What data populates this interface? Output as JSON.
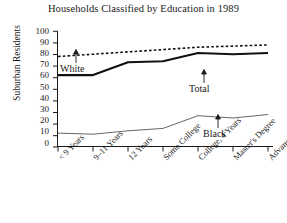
{
  "chart_data": {
    "type": "line",
    "title": "Households Classified by Education in 1989",
    "xlabel": "",
    "ylabel": "Suburban Residents",
    "ylim": [
      0,
      100
    ],
    "yticks": [
      0,
      10,
      20,
      30,
      40,
      50,
      60,
      70,
      80,
      90,
      100
    ],
    "grid": false,
    "legend_position": "inline-annotations",
    "categories": [
      "< 9 Years",
      "9–11 Years",
      "12 Years",
      "Some College",
      "College, 4 Years",
      "Master's Degree",
      "Advanced Degree"
    ],
    "series": [
      {
        "name": "White",
        "style": "dotted",
        "values": [
          78,
          80,
          82,
          84,
          86,
          87,
          88
        ]
      },
      {
        "name": "Total",
        "style": "solid-thick",
        "values": [
          62,
          62,
          73,
          74,
          81,
          80,
          81
        ]
      },
      {
        "name": "Black",
        "style": "solid-thin",
        "values": [
          12,
          11,
          14,
          16,
          27,
          25,
          28
        ]
      }
    ],
    "annotations": [
      {
        "text": "White",
        "points_to": "White"
      },
      {
        "text": "Total",
        "points_to": "Total"
      },
      {
        "text": "Black",
        "points_to": "Black"
      }
    ]
  },
  "axis": {
    "y_labels": [
      "100",
      "90",
      "80",
      "70",
      "60",
      "50",
      "40",
      "30",
      "20",
      "10",
      "0"
    ],
    "y_title": "Suburban Residents"
  },
  "colors": {
    "ink": "#1a1a1a",
    "line_white": "#111111",
    "line_total": "#111111",
    "line_black": "#555555",
    "background": "#ffffff"
  }
}
